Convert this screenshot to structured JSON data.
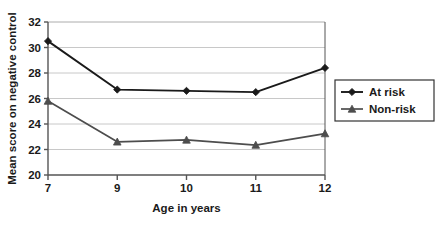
{
  "chart_data": {
    "type": "line",
    "title": "",
    "xlabel": "Age in years",
    "ylabel": "Mean score on negative control",
    "categories": [
      7,
      9,
      10,
      11,
      12
    ],
    "x_tick_labels": [
      "7",
      "9",
      "10",
      "11",
      "12"
    ],
    "y_tick_labels": [
      "20",
      "22",
      "24",
      "26",
      "28",
      "30",
      "32"
    ],
    "y_ticks": [
      20,
      22,
      24,
      26,
      28,
      30,
      32
    ],
    "ylim": [
      20,
      32
    ],
    "grid": "horizontal",
    "legend_position": "right",
    "series": [
      {
        "name": "At risk",
        "marker": "diamond",
        "color": "#1a1a1a",
        "values": [
          30.5,
          26.7,
          26.6,
          26.5,
          28.4
        ]
      },
      {
        "name": "Non-risk",
        "marker": "triangle",
        "color": "#4d4d4d",
        "values": [
          25.8,
          22.6,
          22.75,
          22.35,
          23.25
        ]
      }
    ]
  },
  "colors": {
    "at_risk": "#1a1a1a",
    "non_risk": "#4d4d4d",
    "gridline": "#c8c8c8",
    "axis": "#555555",
    "legend_border": "#333333",
    "background": "#ffffff"
  },
  "legend": {
    "entries": [
      {
        "label": "At risk",
        "marker": "diamond-marker"
      },
      {
        "label": "Non-risk",
        "marker": "triangle-marker"
      }
    ]
  }
}
